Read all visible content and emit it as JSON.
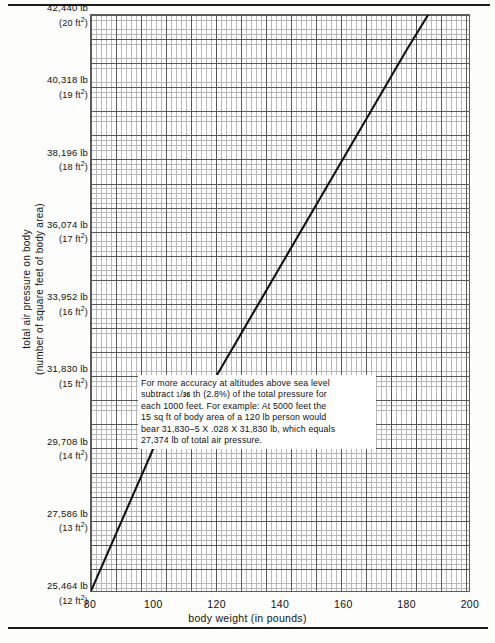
{
  "chart_data": {
    "type": "line",
    "title": "",
    "xlabel": "body weight (in pounds)",
    "ylabel": "total air pressure on body (number of square feet of body area)",
    "ylabel_line1": "total air pressure on body",
    "ylabel_line2": "(number of square feet of body area)",
    "xlim": [
      80,
      200
    ],
    "ylim": [
      25464,
      42440
    ],
    "grid": true,
    "legend": "none",
    "x_ticks": [
      {
        "value": 80,
        "label": "80"
      },
      {
        "value": 100,
        "label": "100"
      },
      {
        "value": 120,
        "label": "120"
      },
      {
        "value": 140,
        "label": "140"
      },
      {
        "value": 160,
        "label": "160"
      },
      {
        "value": 180,
        "label": "180"
      },
      {
        "value": 200,
        "label": "200"
      }
    ],
    "y_ticks": [
      {
        "value": 42440,
        "pounds": "42,440 lb",
        "area": "20",
        "unit": "ft"
      },
      {
        "value": 40318,
        "pounds": "40,318 lb",
        "area": "19",
        "unit": "ft"
      },
      {
        "value": 38196,
        "pounds": "38,196 lb",
        "area": "18",
        "unit": "ft"
      },
      {
        "value": 36074,
        "pounds": "36,074 lb",
        "area": "17",
        "unit": "ft"
      },
      {
        "value": 33952,
        "pounds": "33,952 lb",
        "area": "16",
        "unit": "ft"
      },
      {
        "value": 31830,
        "pounds": "31,830 lb",
        "area": "15",
        "unit": "ft"
      },
      {
        "value": 29708,
        "pounds": "29,708 lb",
        "area": "14",
        "unit": "ft"
      },
      {
        "value": 27586,
        "pounds": "27,586 lb",
        "area": "13",
        "unit": "ft"
      },
      {
        "value": 25464,
        "pounds": "25,464 lb",
        "area": "12",
        "unit": "ft"
      }
    ],
    "series": [
      {
        "name": "total air pressure vs body weight",
        "x": [
          80,
          100,
          120,
          140,
          160,
          180,
          187
        ],
        "values": [
          25464,
          29708,
          31830,
          35014,
          38196,
          41380,
          42440
        ]
      }
    ]
  },
  "annotation": {
    "name": "accuracy-note",
    "line1_a": "For more accuracy at altitudes above sea level",
    "line2_a": "subtract ",
    "frac_num": "1",
    "frac_den": "36",
    "line2_b": " th (2.8%) of the total pressure for",
    "line3": "each 1000 feet. For example: At 5000 feet the",
    "line4": "15 sq ft of body area of a 120 lb person would",
    "line5": "bear 31,830–5 X .028 X 31,830 lb, which equals",
    "line6": "27,374 lb of total air pressure."
  },
  "style": {
    "line_color": "#111111",
    "grid_minor_color": "#b8b8b8",
    "grid_major_color": "#585858",
    "paper": "#ffffff"
  }
}
